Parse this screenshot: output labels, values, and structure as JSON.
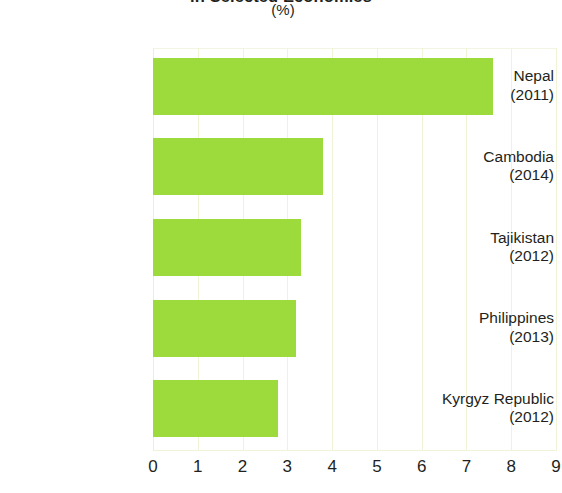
{
  "chart_data": {
    "type": "bar",
    "orientation": "horizontal",
    "title": "in Selected Economies",
    "subtitle": "(%)",
    "xlabel": "",
    "ylabel": "",
    "categories": [
      "Nepal\n(2011)",
      "Cambodia\n(2014)",
      "Tajikistan\n(2012)",
      "Philippines\n(2013)",
      "Kyrgyz Republic\n(2012)"
    ],
    "values": [
      7.6,
      3.8,
      3.3,
      3.2,
      2.8
    ],
    "xlim": [
      0,
      9
    ],
    "xticks": [
      0,
      1,
      2,
      3,
      4,
      5,
      6,
      7,
      8,
      9
    ],
    "grid": true,
    "legend": null,
    "bar_color": "#9ddb3d",
    "grid_color": "#f0f3d6"
  },
  "header": {
    "title": "in Selected Economies",
    "subtitle": "(%)"
  },
  "axis": {
    "x_tick_labels": [
      "0",
      "1",
      "2",
      "3",
      "4",
      "5",
      "6",
      "7",
      "8",
      "9"
    ]
  },
  "bars": [
    {
      "name": "Nepal",
      "year": "(2011)",
      "value": 7.6
    },
    {
      "name": "Cambodia",
      "year": "(2014)",
      "value": 3.8
    },
    {
      "name": "Tajikistan",
      "year": "(2012)",
      "value": 3.3
    },
    {
      "name": "Philippines",
      "year": "(2013)",
      "value": 3.2
    },
    {
      "name": "Kyrgyz Republic",
      "year": "(2012)",
      "value": 2.8
    }
  ]
}
